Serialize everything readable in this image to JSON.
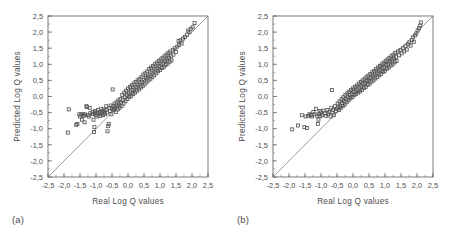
{
  "figure": {
    "panels": [
      {
        "id": "a",
        "caption": "(a)"
      },
      {
        "id": "b",
        "caption": "(b)"
      }
    ]
  },
  "chart_data": [
    {
      "type": "scatter",
      "panel": "a",
      "title": "",
      "xlabel": "Real Log Q values",
      "ylabel": "Predicted Log Q values",
      "xlim": [
        -2.5,
        2.5
      ],
      "ylim": [
        -2.5,
        2.5
      ],
      "xticks": [
        -2.5,
        -2.0,
        -1.5,
        -1.0,
        -0.5,
        0.0,
        0.5,
        1.0,
        1.5,
        2.0,
        2.5
      ],
      "yticks": [
        -2.5,
        -2.0,
        -1.5,
        -1.0,
        -0.5,
        0.0,
        0.5,
        1.0,
        1.5,
        2.0,
        2.5
      ],
      "xticklabels": [
        "-2,5",
        "-2,0",
        "-1,5",
        "-1,0",
        "-0,5",
        "0,0",
        "0,5",
        "1,0",
        "1,5",
        "2,0",
        "2,5"
      ],
      "yticklabels": [
        "-2,5",
        "-2,0",
        "-1,5",
        "-1,0",
        "-0,5",
        "0,0",
        "0,5",
        "1,0",
        "1,5",
        "2,0",
        "2,5"
      ],
      "minor_tick_interval": 0.25,
      "grid": false,
      "legend": null,
      "marker": "open-square",
      "reference_line": {
        "type": "identity",
        "from": [
          -2.5,
          -2.5
        ],
        "to": [
          2.5,
          2.5
        ]
      },
      "points": [
        [
          -1.88,
          -1.12
        ],
        [
          -1.85,
          -0.4
        ],
        [
          -1.62,
          -0.88
        ],
        [
          -1.58,
          -0.85
        ],
        [
          -1.52,
          -0.55
        ],
        [
          -1.5,
          -0.62
        ],
        [
          -1.46,
          -0.56
        ],
        [
          -1.44,
          -0.72
        ],
        [
          -1.4,
          -0.55
        ],
        [
          -1.38,
          -0.6
        ],
        [
          -1.36,
          -0.8
        ],
        [
          -1.34,
          -0.56
        ],
        [
          -1.3,
          -0.3
        ],
        [
          -1.28,
          -0.33
        ],
        [
          -1.26,
          -0.58
        ],
        [
          -1.22,
          -0.62
        ],
        [
          -1.2,
          -0.35
        ],
        [
          -1.18,
          -0.52
        ],
        [
          -1.12,
          -0.55
        ],
        [
          -1.1,
          -0.48
        ],
        [
          -1.08,
          -0.72
        ],
        [
          -1.06,
          -1.1
        ],
        [
          -1.05,
          -0.95
        ],
        [
          -1.04,
          -0.52
        ],
        [
          -1.02,
          -0.45
        ],
        [
          -1.0,
          -0.58
        ],
        [
          -0.98,
          -0.5
        ],
        [
          -0.96,
          -0.62
        ],
        [
          -0.94,
          -0.42
        ],
        [
          -0.9,
          -0.55
        ],
        [
          -0.88,
          -0.48
        ],
        [
          -0.86,
          -0.6
        ],
        [
          -0.84,
          -0.38
        ],
        [
          -0.82,
          -0.52
        ],
        [
          -0.8,
          -0.45
        ],
        [
          -0.78,
          -0.58
        ],
        [
          -0.76,
          -0.4
        ],
        [
          -0.74,
          -0.48
        ],
        [
          -0.72,
          -0.55
        ],
        [
          -0.7,
          -0.42
        ],
        [
          -0.68,
          -0.3
        ],
        [
          -0.66,
          -0.5
        ],
        [
          -0.64,
          -1.08
        ],
        [
          -0.62,
          -0.92
        ],
        [
          -0.6,
          -0.85
        ],
        [
          -0.58,
          -0.35
        ],
        [
          -0.56,
          -0.45
        ],
        [
          -0.54,
          -0.28
        ],
        [
          -0.52,
          -0.55
        ],
        [
          -0.5,
          -0.38
        ],
        [
          -0.48,
          0.22
        ],
        [
          -0.46,
          -0.3
        ],
        [
          -0.44,
          -0.42
        ],
        [
          -0.42,
          -0.22
        ],
        [
          -0.4,
          -0.35
        ],
        [
          -0.38,
          -0.48
        ],
        [
          -0.36,
          -0.18
        ],
        [
          -0.34,
          -0.3
        ],
        [
          -0.32,
          -0.4
        ],
        [
          -0.3,
          -0.12
        ],
        [
          -0.28,
          -0.25
        ],
        [
          -0.26,
          -0.35
        ],
        [
          -0.24,
          -0.08
        ],
        [
          -0.22,
          -0.2
        ],
        [
          -0.2,
          -0.3
        ],
        [
          -0.18,
          0.05
        ],
        [
          -0.16,
          -0.1
        ],
        [
          -0.14,
          -0.22
        ],
        [
          -0.12,
          0.12
        ],
        [
          -0.1,
          -0.02
        ],
        [
          -0.08,
          -0.15
        ],
        [
          -0.06,
          0.18
        ],
        [
          -0.04,
          0.05
        ],
        [
          -0.02,
          -0.08
        ],
        [
          0.0,
          0.25
        ],
        [
          0.02,
          0.1
        ],
        [
          0.04,
          -0.02
        ],
        [
          0.06,
          0.3
        ],
        [
          0.08,
          0.15
        ],
        [
          0.1,
          0.02
        ],
        [
          0.12,
          0.35
        ],
        [
          0.14,
          0.2
        ],
        [
          0.16,
          0.08
        ],
        [
          0.18,
          0.4
        ],
        [
          0.2,
          0.25
        ],
        [
          0.22,
          0.12
        ],
        [
          0.24,
          0.45
        ],
        [
          0.26,
          0.3
        ],
        [
          0.28,
          0.18
        ],
        [
          0.3,
          0.5
        ],
        [
          0.32,
          0.35
        ],
        [
          0.34,
          0.22
        ],
        [
          0.36,
          0.55
        ],
        [
          0.38,
          0.4
        ],
        [
          0.4,
          0.28
        ],
        [
          0.42,
          0.6
        ],
        [
          0.44,
          0.45
        ],
        [
          0.46,
          0.32
        ],
        [
          0.48,
          0.68
        ],
        [
          0.5,
          0.52
        ],
        [
          0.52,
          0.38
        ],
        [
          0.54,
          0.72
        ],
        [
          0.56,
          0.58
        ],
        [
          0.58,
          0.44
        ],
        [
          0.6,
          0.78
        ],
        [
          0.62,
          0.62
        ],
        [
          0.64,
          0.5
        ],
        [
          0.66,
          0.85
        ],
        [
          0.68,
          0.68
        ],
        [
          0.7,
          0.55
        ],
        [
          0.72,
          0.9
        ],
        [
          0.74,
          0.74
        ],
        [
          0.76,
          0.6
        ],
        [
          0.78,
          0.95
        ],
        [
          0.8,
          0.8
        ],
        [
          0.82,
          0.66
        ],
        [
          0.84,
          1.0
        ],
        [
          0.86,
          0.85
        ],
        [
          0.88,
          0.72
        ],
        [
          0.9,
          1.05
        ],
        [
          0.92,
          0.9
        ],
        [
          0.94,
          0.78
        ],
        [
          0.96,
          1.1
        ],
        [
          0.98,
          0.95
        ],
        [
          1.0,
          0.82
        ],
        [
          1.02,
          1.15
        ],
        [
          1.04,
          1.0
        ],
        [
          1.06,
          0.88
        ],
        [
          1.08,
          1.2
        ],
        [
          1.1,
          1.05
        ],
        [
          1.12,
          0.92
        ],
        [
          1.14,
          1.25
        ],
        [
          1.16,
          1.1
        ],
        [
          1.18,
          0.98
        ],
        [
          1.2,
          1.3
        ],
        [
          1.22,
          1.15
        ],
        [
          1.24,
          1.02
        ],
        [
          1.26,
          1.35
        ],
        [
          1.28,
          1.2
        ],
        [
          1.3,
          1.08
        ],
        [
          1.32,
          1.4
        ],
        [
          1.34,
          1.25
        ],
        [
          1.36,
          1.12
        ],
        [
          1.4,
          1.45
        ],
        [
          1.42,
          1.3
        ],
        [
          1.46,
          1.5
        ],
        [
          1.5,
          1.38
        ],
        [
          1.54,
          1.55
        ],
        [
          1.58,
          1.72
        ],
        [
          1.6,
          1.6
        ],
        [
          1.64,
          1.75
        ],
        [
          1.68,
          1.65
        ],
        [
          1.72,
          1.8
        ],
        [
          1.78,
          1.85
        ],
        [
          1.84,
          1.92
        ],
        [
          1.88,
          2.05
        ],
        [
          1.92,
          2.0
        ],
        [
          1.96,
          2.1
        ],
        [
          2.02,
          2.15
        ],
        [
          2.08,
          2.28
        ]
      ]
    },
    {
      "type": "scatter",
      "panel": "b",
      "title": "",
      "xlabel": "Real Log Q values",
      "ylabel": "Predicted Log Q values",
      "xlim": [
        -2.5,
        2.5
      ],
      "ylim": [
        -2.5,
        2.5
      ],
      "xticks": [
        -2.5,
        -2.0,
        -1.5,
        -1.0,
        -0.5,
        0.0,
        0.5,
        1.0,
        1.5,
        2.0,
        2.5
      ],
      "yticks": [
        -2.5,
        -2.0,
        -1.5,
        -1.0,
        -0.5,
        0.0,
        0.5,
        1.0,
        1.5,
        2.0,
        2.5
      ],
      "xticklabels": [
        "-2,5",
        "-2,0",
        "-1,5",
        "-1,0",
        "-0,5",
        "0,0",
        "0,5",
        "1,0",
        "1,5",
        "2,0",
        "2,5"
      ],
      "yticklabels": [
        "-2,5",
        "-2,0",
        "-1,5",
        "-1,0",
        "-0,5",
        "0,0",
        "0,5",
        "1,0",
        "1,5",
        "2,0",
        "2,5"
      ],
      "minor_tick_interval": 0.25,
      "grid": false,
      "legend": null,
      "marker": "open-square",
      "reference_line": {
        "type": "identity",
        "from": [
          -2.5,
          -2.5
        ],
        "to": [
          2.5,
          2.5
        ]
      },
      "points": [
        [
          -1.9,
          -1.02
        ],
        [
          -1.72,
          -0.9
        ],
        [
          -1.6,
          -0.58
        ],
        [
          -1.52,
          -0.95
        ],
        [
          -1.48,
          -0.62
        ],
        [
          -1.44,
          -0.98
        ],
        [
          -1.4,
          -0.6
        ],
        [
          -1.36,
          -0.55
        ],
        [
          -1.32,
          -0.58
        ],
        [
          -1.28,
          -0.62
        ],
        [
          -1.24,
          -0.48
        ],
        [
          -1.2,
          -0.55
        ],
        [
          -1.16,
          -0.38
        ],
        [
          -1.12,
          -0.6
        ],
        [
          -1.1,
          -0.85
        ],
        [
          -1.08,
          -0.72
        ],
        [
          -1.06,
          -0.55
        ],
        [
          -1.04,
          -0.45
        ],
        [
          -1.02,
          -0.62
        ],
        [
          -1.0,
          -0.5
        ],
        [
          -0.96,
          -0.58
        ],
        [
          -0.92,
          -0.44
        ],
        [
          -0.88,
          -0.52
        ],
        [
          -0.84,
          -0.6
        ],
        [
          -0.8,
          -0.42
        ],
        [
          -0.78,
          -0.55
        ],
        [
          -0.74,
          -0.48
        ],
        [
          -0.7,
          -0.62
        ],
        [
          -0.68,
          -0.35
        ],
        [
          -0.66,
          0.2
        ],
        [
          -0.64,
          -0.5
        ],
        [
          -0.62,
          -0.42
        ],
        [
          -0.6,
          -0.58
        ],
        [
          -0.56,
          -0.3
        ],
        [
          -0.54,
          -0.45
        ],
        [
          -0.5,
          -0.38
        ],
        [
          -0.48,
          -0.22
        ],
        [
          -0.46,
          -0.32
        ],
        [
          -0.44,
          -0.42
        ],
        [
          -0.42,
          -0.15
        ],
        [
          -0.4,
          -0.28
        ],
        [
          -0.38,
          -0.35
        ],
        [
          -0.36,
          -0.08
        ],
        [
          -0.34,
          -0.2
        ],
        [
          -0.32,
          -0.3
        ],
        [
          -0.3,
          -0.02
        ],
        [
          -0.28,
          -0.14
        ],
        [
          -0.26,
          -0.25
        ],
        [
          -0.24,
          0.05
        ],
        [
          -0.22,
          -0.08
        ],
        [
          -0.2,
          -0.18
        ],
        [
          -0.18,
          0.1
        ],
        [
          -0.16,
          -0.02
        ],
        [
          -0.14,
          -0.12
        ],
        [
          -0.12,
          0.15
        ],
        [
          -0.1,
          0.04
        ],
        [
          -0.08,
          -0.06
        ],
        [
          -0.06,
          0.2
        ],
        [
          -0.04,
          0.08
        ],
        [
          -0.02,
          -0.02
        ],
        [
          0.0,
          0.25
        ],
        [
          0.02,
          0.14
        ],
        [
          0.04,
          0.04
        ],
        [
          0.06,
          0.3
        ],
        [
          0.08,
          0.18
        ],
        [
          0.1,
          0.08
        ],
        [
          0.12,
          0.34
        ],
        [
          0.14,
          0.22
        ],
        [
          0.16,
          0.12
        ],
        [
          0.18,
          0.4
        ],
        [
          0.2,
          0.28
        ],
        [
          0.22,
          0.16
        ],
        [
          0.24,
          0.45
        ],
        [
          0.26,
          0.32
        ],
        [
          0.28,
          0.2
        ],
        [
          0.3,
          0.5
        ],
        [
          0.32,
          0.38
        ],
        [
          0.34,
          0.26
        ],
        [
          0.36,
          0.55
        ],
        [
          0.38,
          0.42
        ],
        [
          0.4,
          0.3
        ],
        [
          0.42,
          0.6
        ],
        [
          0.44,
          0.48
        ],
        [
          0.46,
          0.36
        ],
        [
          0.48,
          0.65
        ],
        [
          0.5,
          0.52
        ],
        [
          0.52,
          0.4
        ],
        [
          0.54,
          0.7
        ],
        [
          0.56,
          0.58
        ],
        [
          0.58,
          0.46
        ],
        [
          0.6,
          0.75
        ],
        [
          0.62,
          0.62
        ],
        [
          0.64,
          0.5
        ],
        [
          0.66,
          0.8
        ],
        [
          0.68,
          0.68
        ],
        [
          0.7,
          0.56
        ],
        [
          0.72,
          0.85
        ],
        [
          0.74,
          0.72
        ],
        [
          0.76,
          0.6
        ],
        [
          0.78,
          0.9
        ],
        [
          0.8,
          0.78
        ],
        [
          0.82,
          0.66
        ],
        [
          0.84,
          0.95
        ],
        [
          0.86,
          0.82
        ],
        [
          0.88,
          0.7
        ],
        [
          0.9,
          1.0
        ],
        [
          0.92,
          0.88
        ],
        [
          0.94,
          0.76
        ],
        [
          0.96,
          1.05
        ],
        [
          0.98,
          0.92
        ],
        [
          1.0,
          0.8
        ],
        [
          1.02,
          1.1
        ],
        [
          1.04,
          0.98
        ],
        [
          1.06,
          0.86
        ],
        [
          1.08,
          1.15
        ],
        [
          1.1,
          1.02
        ],
        [
          1.12,
          0.9
        ],
        [
          1.14,
          1.2
        ],
        [
          1.16,
          1.08
        ],
        [
          1.18,
          0.96
        ],
        [
          1.2,
          1.25
        ],
        [
          1.22,
          1.12
        ],
        [
          1.24,
          1.0
        ],
        [
          1.26,
          1.3
        ],
        [
          1.28,
          1.18
        ],
        [
          1.3,
          1.06
        ],
        [
          1.32,
          1.35
        ],
        [
          1.34,
          1.22
        ],
        [
          1.36,
          1.1
        ],
        [
          1.4,
          1.4
        ],
        [
          1.44,
          1.28
        ],
        [
          1.48,
          1.45
        ],
        [
          1.52,
          1.34
        ],
        [
          1.56,
          1.5
        ],
        [
          1.6,
          1.4
        ],
        [
          1.64,
          1.56
        ],
        [
          1.68,
          1.46
        ],
        [
          1.72,
          1.62
        ],
        [
          1.76,
          1.68
        ],
        [
          1.8,
          1.58
        ],
        [
          1.84,
          1.75
        ],
        [
          1.88,
          1.84
        ],
        [
          1.9,
          1.7
        ],
        [
          1.94,
          1.9
        ],
        [
          1.98,
          1.96
        ],
        [
          2.02,
          2.05
        ],
        [
          2.06,
          2.12
        ],
        [
          2.1,
          2.2
        ],
        [
          2.12,
          2.3
        ]
      ]
    }
  ]
}
